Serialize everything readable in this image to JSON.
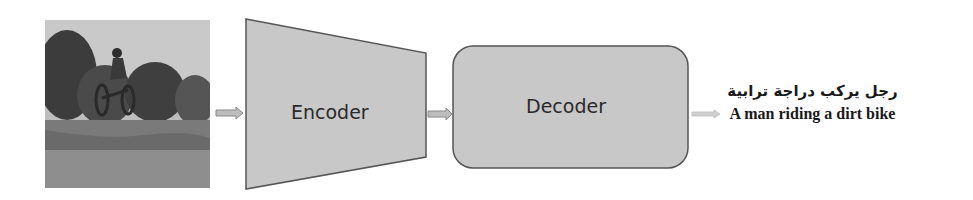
{
  "input_image": {
    "description": "Grayscale photo of a man riding a dirt bike jumping over a grassy dirt track with trees in background"
  },
  "encoder": {
    "label": "Encoder"
  },
  "decoder": {
    "label": "Decoder"
  },
  "output": {
    "caption_arabic": "رجل يركب دراجة ترابية",
    "caption_english": "A man riding a dirt bike"
  },
  "colors": {
    "block_fill": "#c8c8c8",
    "block_stroke": "#555555",
    "arrow_fill": "#bdbdbd",
    "arrow_stroke": "#8a8a8a",
    "output_arrow": "#cfcfcf"
  }
}
